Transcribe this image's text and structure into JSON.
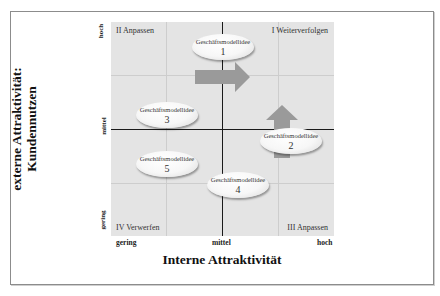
{
  "diagram": {
    "type": "portfolio-matrix",
    "x_axis": {
      "title": "Interne Attraktivität",
      "ticks": [
        "gering",
        "mittel",
        "hoch"
      ]
    },
    "y_axis": {
      "title_line1": "externe Attraktivität:",
      "title_line2": "Kundennutzen",
      "ticks": [
        "gering",
        "mittel",
        "hoch"
      ]
    },
    "quadrants": {
      "top_left": "II Anpassen",
      "top_right": "I Weiterverfolgen",
      "bottom_left": "IV Verwerfen",
      "bottom_right": "III Anpassen"
    },
    "ideas": [
      {
        "label": "Geschäftsmodellidee",
        "number": "1",
        "x": "mittel",
        "y": "hoch",
        "arrow": "right"
      },
      {
        "label": "Geschäftsmodellidee",
        "number": "2",
        "x": "hoch",
        "y": "mittel-gering",
        "arrow": "up"
      },
      {
        "label": "Geschäftsmodellidee",
        "number": "3",
        "x": "gering-mittel",
        "y": "mittel-hoch"
      },
      {
        "label": "Geschäftsmodellidee",
        "number": "4",
        "x": "mittel",
        "y": "gering"
      },
      {
        "label": "Geschäftsmodellidee",
        "number": "5",
        "x": "gering-mittel",
        "y": "mittel-gering"
      }
    ],
    "colors": {
      "background": "#e4e4e4",
      "grid": "#cdcdcd",
      "axis": "#1a1a1a",
      "arrow": "#9a9a9a"
    }
  }
}
